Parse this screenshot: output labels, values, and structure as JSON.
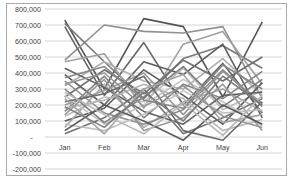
{
  "chart_data": {
    "type": "line",
    "title": "",
    "xlabel": "",
    "ylabel": "",
    "categories": [
      "Jan",
      "Feb",
      "Mar",
      "Apr",
      "May",
      "Jun"
    ],
    "ylim": [
      -200000,
      800000
    ],
    "yticks": [
      "800,000",
      "700,000",
      "600,000",
      "500,000",
      "400,000",
      "300,000",
      "200,000",
      "100,000",
      "-",
      "-100,000",
      "-200,000"
    ],
    "ytick_values": [
      800000,
      700000,
      600000,
      500000,
      400000,
      300000,
      200000,
      100000,
      0,
      -100000,
      -200000
    ],
    "grid": true,
    "legend": "none",
    "series": [
      {
        "name": "S1",
        "color": "#555555",
        "values": [
          730000,
          300000,
          740000,
          690000,
          250000,
          720000
        ]
      },
      {
        "name": "S2",
        "color": "#909090",
        "values": [
          480000,
          700000,
          660000,
          650000,
          690000,
          240000
        ]
      },
      {
        "name": "S3",
        "color": "#666666",
        "values": [
          690000,
          260000,
          590000,
          200000,
          460000,
          150000
        ]
      },
      {
        "name": "S4",
        "color": "#7a7a7a",
        "values": [
          710000,
          470000,
          240000,
          490000,
          570000,
          430000
        ]
      },
      {
        "name": "S5",
        "color": "#a0a0a0",
        "values": [
          470000,
          520000,
          180000,
          580000,
          660000,
          330000
        ]
      },
      {
        "name": "S6",
        "color": "#5e5e5e",
        "values": [
          390000,
          200000,
          470000,
          390000,
          580000,
          120000
        ]
      },
      {
        "name": "S7",
        "color": "#b0b0b0",
        "values": [
          320000,
          470000,
          350000,
          300000,
          490000,
          260000
        ]
      },
      {
        "name": "S8",
        "color": "#6f6f6f",
        "values": [
          250000,
          420000,
          270000,
          480000,
          350000,
          500000
        ]
      },
      {
        "name": "S9",
        "color": "#999999",
        "values": [
          200000,
          290000,
          400000,
          140000,
          410000,
          210000
        ]
      },
      {
        "name": "S10",
        "color": "#848484",
        "values": [
          160000,
          380000,
          120000,
          330000,
          240000,
          410000
        ]
      },
      {
        "name": "S11",
        "color": "#bdbdbd",
        "values": [
          130000,
          250000,
          220000,
          430000,
          170000,
          290000
        ]
      },
      {
        "name": "S12",
        "color": "#5a5a5a",
        "values": [
          100000,
          180000,
          420000,
          260000,
          80000,
          340000
        ]
      },
      {
        "name": "S13",
        "color": "#a8a8a8",
        "values": [
          60000,
          330000,
          60000,
          220000,
          300000,
          160000
        ]
      },
      {
        "name": "S14",
        "color": "#737373",
        "values": [
          20000,
          120000,
          300000,
          20000,
          120000,
          240000
        ]
      },
      {
        "name": "S15",
        "color": "#c4c4c4",
        "values": [
          260000,
          80000,
          200000,
          360000,
          220000,
          70000
        ]
      },
      {
        "name": "S16",
        "color": "#8c8c8c",
        "values": [
          350000,
          150000,
          80000,
          170000,
          420000,
          190000
        ]
      },
      {
        "name": "S17",
        "color": "#626262",
        "values": [
          430000,
          310000,
          160000,
          80000,
          260000,
          280000
        ]
      },
      {
        "name": "S18",
        "color": "#b5b5b5",
        "values": [
          180000,
          230000,
          330000,
          240000,
          40000,
          110000
        ]
      },
      {
        "name": "S19",
        "color": "#7e7e7e",
        "values": [
          300000,
          90000,
          250000,
          440000,
          190000,
          360000
        ]
      },
      {
        "name": "S20",
        "color": "#9a9a9a",
        "values": [
          140000,
          360000,
          40000,
          120000,
          330000,
          40000
        ]
      },
      {
        "name": "S21",
        "color": "#6a6a6a",
        "values": [
          220000,
          270000,
          380000,
          40000,
          -20000,
          220000
        ]
      },
      {
        "name": "S22",
        "color": "#c0c0c0",
        "values": [
          80000,
          40000,
          140000,
          290000,
          150000,
          170000
        ]
      },
      {
        "name": "S23",
        "color": "#878787",
        "values": [
          370000,
          440000,
          230000,
          180000,
          450000,
          300000
        ]
      },
      {
        "name": "S24",
        "color": "#a4a4a4",
        "values": [
          240000,
          20000,
          300000,
          390000,
          90000,
          140000
        ]
      },
      {
        "name": "S25",
        "color": "#595959",
        "values": [
          40000,
          200000,
          100000,
          -20000,
          200000,
          80000
        ]
      },
      {
        "name": "S26",
        "color": "#b8b8b8",
        "values": [
          280000,
          140000,
          20000,
          210000,
          10000,
          260000
        ]
      },
      {
        "name": "S27",
        "color": "#7c7c7c",
        "values": [
          190000,
          60000,
          280000,
          100000,
          380000,
          200000
        ]
      },
      {
        "name": "S28",
        "color": "#969696",
        "values": [
          330000,
          400000,
          190000,
          320000,
          130000,
          60000
        ]
      }
    ]
  }
}
